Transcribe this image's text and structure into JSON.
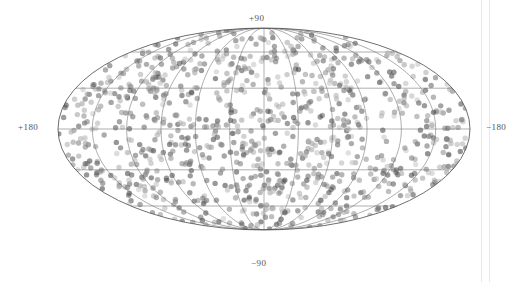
{
  "figure": {
    "kind": "all-sky-scatter-projection",
    "projection": "mollweide",
    "background_color": "#ffffff",
    "ellipse": {
      "center_x": 264,
      "center_y": 129,
      "semi_axis_x": 206,
      "semi_axis_y": 101,
      "outline_color": "#4a4a4a",
      "outline_width": 0.8
    },
    "graticule": {
      "meridian_step_deg": 30,
      "parallel_step_deg": 30,
      "color": "#6b6b6b",
      "width": 0.55,
      "visible": true
    },
    "points": {
      "marker": "circle",
      "count": 1000,
      "diameter_px": 5.4,
      "opacity": 0.55,
      "color_min": "#3a3a3a",
      "color_max": "#c8c8c8"
    }
  },
  "labels": {
    "north_pole": "+90",
    "south_pole": "−90",
    "left_longitude": "+180",
    "right_longitude": "−180"
  },
  "edge_rules": {
    "count": 2,
    "color": "#e9e9e9"
  },
  "chart_data": {
    "type": "scatter",
    "title": "",
    "xlabel": "",
    "ylabel": "",
    "projection": "mollweide",
    "grid": true,
    "legend": "none",
    "xlim": [
      180,
      -180
    ],
    "ylim": [
      -90,
      90
    ],
    "xticks": [
      "+180",
      "-180"
    ],
    "yticks": [
      "+90",
      "-90"
    ],
    "series": [
      {
        "name": "sources",
        "n_points": 1000,
        "marker": "circle",
        "marker_size_px": 5.4,
        "alpha": 0.55,
        "colormap": "greys",
        "distribution": "uniform-on-sphere",
        "longitude_range_deg": [
          -180,
          180
        ],
        "latitude_range_deg": [
          -90,
          90
        ]
      }
    ],
    "annotations": []
  }
}
